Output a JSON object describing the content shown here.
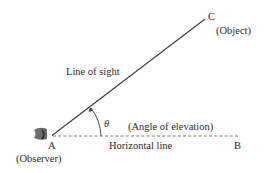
{
  "diagram": {
    "title": "Angle of elevation",
    "points": {
      "A": {
        "label": "A",
        "caption": "(Observer)"
      },
      "B": {
        "label": "B"
      },
      "C": {
        "label": "C",
        "caption": "(Object)"
      }
    },
    "line_of_sight_label": "Line of sight",
    "horizontal_line_label": "Horizontal line",
    "angle_symbol": "θ",
    "angle_label": "(Angle of elevation)",
    "colors": {
      "line": "#3a3a3a",
      "text": "#2a2a2a",
      "dashed": "#555555"
    }
  }
}
